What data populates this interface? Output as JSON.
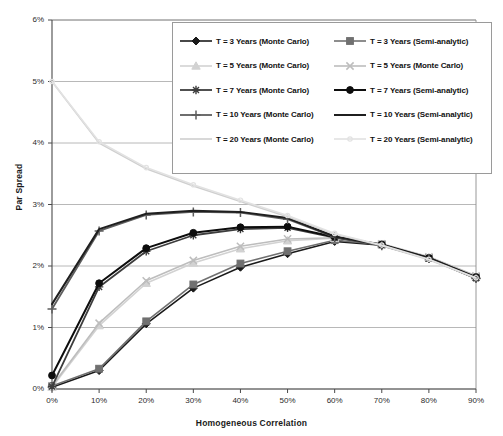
{
  "chart_data": {
    "type": "line",
    "title": "",
    "xlabel": "Homogeneous Correlation",
    "ylabel": "Par Spread",
    "x": [
      0,
      10,
      20,
      30,
      40,
      50,
      60,
      70,
      80,
      90
    ],
    "xtick_labels": [
      "0%",
      "10%",
      "20%",
      "30%",
      "40%",
      "50%",
      "60%",
      "70%",
      "80%",
      "90%"
    ],
    "ytick_labels": [
      "0%",
      "1%",
      "2%",
      "3%",
      "4%",
      "5%",
      "6%"
    ],
    "ytick_values": [
      0,
      1,
      2,
      3,
      4,
      5,
      6
    ],
    "xlim": [
      0,
      90
    ],
    "ylim": [
      0,
      6
    ],
    "grid": "horizontal",
    "legend_position": "top-right-inside",
    "units": "percent",
    "series": [
      {
        "name": "T = 3 Years (Monte Carlo)",
        "marker": "diamond",
        "color": "#1a1a1a",
        "width": 1.6,
        "values": [
          0.03,
          0.3,
          1.06,
          1.64,
          1.98,
          2.2,
          2.4,
          2.34,
          2.12,
          1.8
        ]
      },
      {
        "name": "T = 3 Years (Semi-analytic)",
        "marker": "square",
        "color": "#707070",
        "width": 1.6,
        "values": [
          0.05,
          0.33,
          1.1,
          1.7,
          2.04,
          2.24,
          2.42,
          2.35,
          2.13,
          1.82
        ]
      },
      {
        "name": "T = 5 Years (Monte Carlo)",
        "marker": "triangle",
        "color": "#d2d2d2",
        "width": 1.6,
        "values": [
          0.03,
          1.03,
          1.72,
          2.05,
          2.28,
          2.41,
          2.45,
          2.35,
          2.14,
          1.83
        ]
      },
      {
        "name": "T = 5 Years (Monte Carlo)",
        "marker": "cross",
        "color": "#bdbdbd",
        "width": 1.6,
        "values": [
          0.05,
          1.07,
          1.76,
          2.09,
          2.32,
          2.44,
          2.46,
          2.36,
          2.15,
          1.84
        ]
      },
      {
        "name": "T = 7 Years (Monte Carlo)",
        "marker": "asterisk",
        "color": "#3d3d3d",
        "width": 1.8,
        "values": [
          0.04,
          1.66,
          2.24,
          2.5,
          2.6,
          2.62,
          2.46,
          2.34,
          2.12,
          1.8
        ]
      },
      {
        "name": "T = 7 Years (Semi-analytic)",
        "marker": "circle",
        "color": "#0d0d0d",
        "width": 2.0,
        "values": [
          0.22,
          1.72,
          2.29,
          2.54,
          2.63,
          2.64,
          2.47,
          2.35,
          2.13,
          1.82
        ]
      },
      {
        "name": "T = 10 Years (Monte Carlo)",
        "marker": "plus",
        "color": "#5e5e5e",
        "width": 1.8,
        "values": [
          1.3,
          2.57,
          2.83,
          2.88,
          2.87,
          2.76,
          2.47,
          2.33,
          2.12,
          1.8
        ]
      },
      {
        "name": "T = 10 Years (Semi-analytic)",
        "marker": "none",
        "color": "#1f1f1f",
        "width": 2.0,
        "values": [
          1.38,
          2.6,
          2.85,
          2.9,
          2.88,
          2.78,
          2.48,
          2.34,
          2.13,
          1.81
        ]
      },
      {
        "name": "T = 20 Years (Monte Carlo)",
        "marker": "none",
        "color": "#cfcfcf",
        "width": 1.6,
        "values": [
          5.0,
          4.0,
          3.58,
          3.3,
          3.05,
          2.8,
          2.52,
          2.33,
          2.1,
          1.8
        ]
      },
      {
        "name": "T = 20 Years (Semi-analytic)",
        "marker": "dot",
        "color": "#e2e2e2",
        "width": 1.6,
        "values": [
          5.0,
          4.02,
          3.6,
          3.32,
          3.07,
          2.82,
          2.53,
          2.34,
          2.11,
          1.81
        ]
      }
    ]
  },
  "legend": {
    "entries": [
      "T = 3 Years (Monte Carlo)",
      "T = 3 Years (Semi-analytic)",
      "T = 5 Years (Monte Carlo)",
      "T = 5 Years (Monte Carlo)",
      "T = 7 Years (Monte Carlo)",
      "T = 7 Years (Semi-analytic)",
      "T = 10 Years (Monte Carlo)",
      "T = 10 Years (Semi-analytic)",
      "T = 20 Years (Monte Carlo)",
      "T = 20 Years (Semi-analytic)"
    ]
  }
}
